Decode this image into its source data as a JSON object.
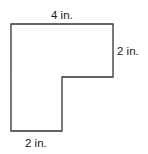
{
  "diagram": {
    "shape": "L-shaped polygon",
    "labels": {
      "top": "4 in.",
      "right": "2 in.",
      "bottom": "2 in."
    },
    "colors": {
      "stroke": "#333333",
      "text": "#1a1a1a",
      "background": "#ffffff"
    }
  }
}
